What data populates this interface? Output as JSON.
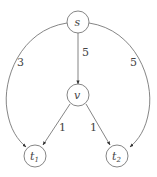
{
  "diagram": {
    "type": "directed-graph",
    "nodes": {
      "s": {
        "label": "s",
        "sub": ""
      },
      "v": {
        "label": "v",
        "sub": ""
      },
      "t1": {
        "label": "t",
        "sub": "1"
      },
      "t2": {
        "label": "t",
        "sub": "2"
      }
    },
    "edges": {
      "s_t1": {
        "from": "s",
        "to": "t1",
        "weight": "3"
      },
      "s_v": {
        "from": "s",
        "to": "v",
        "weight": "5"
      },
      "s_t2": {
        "from": "s",
        "to": "t2",
        "weight": "5"
      },
      "v_t1": {
        "from": "v",
        "to": "t1",
        "weight": "1"
      },
      "v_t2": {
        "from": "v",
        "to": "t2",
        "weight": "1"
      }
    }
  }
}
